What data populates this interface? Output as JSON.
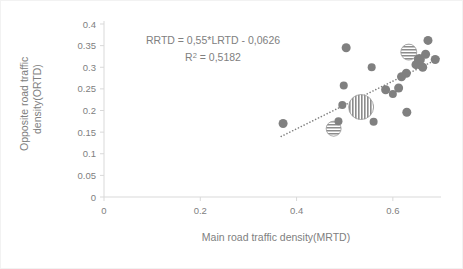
{
  "chart_data": {
    "type": "scatter",
    "title": "",
    "xlabel": "Main road traffic density(MRTD)",
    "ylabel_line1": "Opposite road traffic",
    "ylabel_line2": "density(ORTD)",
    "ylabel": "Opposite road traffic density(ORTD)",
    "xlim": [
      0,
      0.7
    ],
    "ylim": [
      0,
      0.4
    ],
    "xticks": [
      0,
      0.2,
      0.4,
      0.6
    ],
    "xtick_labels": [
      "0",
      "0.2",
      "0.4",
      "0.6"
    ],
    "yticks": [
      0,
      0.05,
      0.1,
      0.15,
      0.2,
      0.25,
      0.3,
      0.35,
      0.4
    ],
    "ytick_labels": [
      "0",
      "0.05",
      "0.1",
      "0.15",
      "0.2",
      "0.25",
      "0.3",
      "0.35",
      "0.4"
    ],
    "grid": false,
    "legend": "none",
    "marker_color": "#808080",
    "trendline_color": "#808080",
    "annotation_line1": "RRTD = 0,55*LRTD - 0,0626",
    "annotation_line2_prefix": "R",
    "annotation_line2_sup": "2",
    "annotation_line2_rest": " = 0,5182",
    "annotation_line2": "R² = 0,5182",
    "equation": {
      "slope": 0.55,
      "intercept": -0.0626,
      "r_squared": 0.5182,
      "dependent": "RRTD",
      "independent": "LRTD"
    },
    "trendline": {
      "x_start": 0.368,
      "y_start": 0.14,
      "x_end": 0.7,
      "y_end": 0.323,
      "style": "dotted"
    },
    "points": [
      {
        "x": 0.372,
        "y": 0.17,
        "r": 4.5,
        "fill": "solid"
      },
      {
        "x": 0.477,
        "y": 0.158,
        "r": 7.5,
        "fill": "horizontal-stripes"
      },
      {
        "x": 0.487,
        "y": 0.175,
        "r": 4.0,
        "fill": "solid"
      },
      {
        "x": 0.495,
        "y": 0.213,
        "r": 4.0,
        "fill": "solid"
      },
      {
        "x": 0.498,
        "y": 0.258,
        "r": 4.0,
        "fill": "solid"
      },
      {
        "x": 0.503,
        "y": 0.345,
        "r": 4.5,
        "fill": "solid"
      },
      {
        "x": 0.534,
        "y": 0.208,
        "r": 12.5,
        "fill": "vertical-stripes"
      },
      {
        "x": 0.56,
        "y": 0.174,
        "r": 4.0,
        "fill": "solid"
      },
      {
        "x": 0.556,
        "y": 0.3,
        "r": 4.0,
        "fill": "solid"
      },
      {
        "x": 0.585,
        "y": 0.248,
        "r": 4.5,
        "fill": "solid"
      },
      {
        "x": 0.6,
        "y": 0.238,
        "r": 4.0,
        "fill": "solid"
      },
      {
        "x": 0.612,
        "y": 0.252,
        "r": 4.5,
        "fill": "solid"
      },
      {
        "x": 0.618,
        "y": 0.278,
        "r": 4.5,
        "fill": "solid"
      },
      {
        "x": 0.628,
        "y": 0.286,
        "r": 4.5,
        "fill": "solid"
      },
      {
        "x": 0.633,
        "y": 0.335,
        "r": 8.0,
        "fill": "horizontal-stripes"
      },
      {
        "x": 0.629,
        "y": 0.196,
        "r": 4.5,
        "fill": "solid"
      },
      {
        "x": 0.648,
        "y": 0.306,
        "r": 4.5,
        "fill": "solid"
      },
      {
        "x": 0.655,
        "y": 0.318,
        "r": 5.5,
        "fill": "solid"
      },
      {
        "x": 0.662,
        "y": 0.3,
        "r": 4.5,
        "fill": "solid"
      },
      {
        "x": 0.668,
        "y": 0.33,
        "r": 4.5,
        "fill": "solid"
      },
      {
        "x": 0.673,
        "y": 0.362,
        "r": 4.5,
        "fill": "solid"
      },
      {
        "x": 0.688,
        "y": 0.318,
        "r": 4.5,
        "fill": "solid"
      }
    ]
  }
}
